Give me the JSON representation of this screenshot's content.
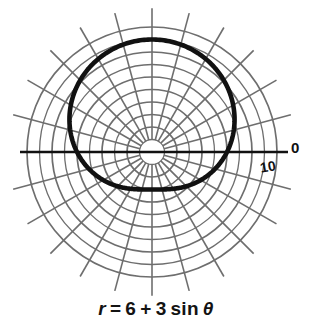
{
  "figure": {
    "kind": "polar-plot",
    "caption_parts": {
      "r": "r",
      "equals": "=",
      "a": "6",
      "plus": "+",
      "b": "3",
      "func": "sin",
      "theta": "θ"
    },
    "caption_text": "r = 6 + 3 sin θ",
    "axis_labels": {
      "polar_axis": "0",
      "radial_tick": "10"
    },
    "colors": {
      "curve": "#111111",
      "grid": "#6e6e6e",
      "axis": "#111111",
      "background": "#ffffff",
      "text": "#131313"
    }
  },
  "chart_data": {
    "type": "line",
    "coordinate_system": "polar",
    "equation": "r = 6 + 3*sin(theta)",
    "curve_name": "limacon",
    "xlabel": "",
    "ylabel": "",
    "rlim": [
      0,
      10
    ],
    "grid": true,
    "legend": null,
    "center_px": [
      152,
      152
    ],
    "px_per_unit": 12.5,
    "radial_ticks": [
      2,
      4,
      6,
      8,
      10
    ],
    "radial_tick_labels_shown": [
      "10"
    ],
    "angular_tick_labels_shown": [
      "0"
    ],
    "angular_spoke_step_deg": 15,
    "angular_spokes_deg": [
      0,
      15,
      30,
      45,
      60,
      75,
      90,
      105,
      120,
      135,
      150,
      165,
      180,
      195,
      210,
      225,
      240,
      255,
      270,
      285,
      300,
      315,
      330,
      345
    ],
    "grid_circles_r": [
      1,
      2,
      3,
      4,
      5,
      6,
      7,
      8,
      9,
      10
    ],
    "theta_deg": [
      0,
      15,
      30,
      45,
      60,
      75,
      90,
      105,
      120,
      135,
      150,
      165,
      180,
      195,
      210,
      225,
      240,
      255,
      270,
      285,
      300,
      315,
      330,
      345,
      360
    ],
    "r_values": [
      6.0,
      6.78,
      7.5,
      8.12,
      8.6,
      8.9,
      9.0,
      8.9,
      8.6,
      8.12,
      7.5,
      6.78,
      6.0,
      5.22,
      4.5,
      3.88,
      3.4,
      3.1,
      3.0,
      3.1,
      3.4,
      3.88,
      4.5,
      5.22,
      6.0
    ],
    "key_points": [
      {
        "theta_deg": 0,
        "r": 6
      },
      {
        "theta_deg": 90,
        "r": 9
      },
      {
        "theta_deg": 180,
        "r": 6
      },
      {
        "theta_deg": 270,
        "r": 3
      }
    ]
  }
}
